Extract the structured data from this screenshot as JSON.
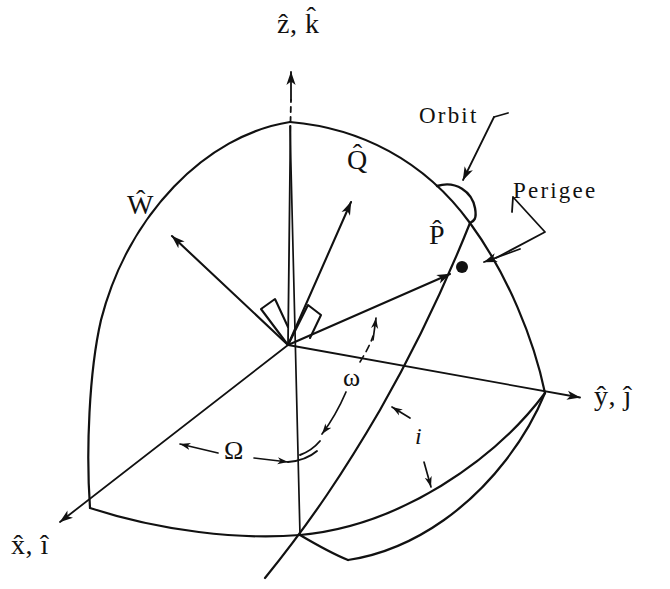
{
  "figure": {
    "background_color": "#ffffff",
    "stroke_color": "#111111",
    "width": 670,
    "height": 589
  },
  "labels": {
    "z_axis": "ẑ, k̂",
    "y_axis": "ŷ, ĵ",
    "x_axis": "x̂, î",
    "w_vector": "Ŵ",
    "q_vector": "Q̂",
    "p_vector": "P̂",
    "orbit": "Orbit",
    "perigee": "Perigee",
    "raan_symbol": "Ω",
    "arg_perigee_symbol": "ω",
    "inclination_symbol": "i"
  },
  "annotations": [
    {
      "name": "z-axis-label",
      "text": "ẑ, k̂",
      "x": 277,
      "y": 12,
      "kind": "axis"
    },
    {
      "name": "y-axis-label",
      "text": "ŷ, ĵ",
      "x": 592,
      "y": 381,
      "kind": "axis"
    },
    {
      "name": "x-axis-label",
      "text": "x̂, î",
      "x": 10,
      "y": 530,
      "kind": "axis"
    },
    {
      "name": "w-vector-label",
      "text": "Ŵ",
      "x": 128,
      "y": 192,
      "kind": "vector"
    },
    {
      "name": "q-vector-label",
      "text": "Q̂",
      "x": 347,
      "y": 147,
      "kind": "vector"
    },
    {
      "name": "p-vector-label",
      "text": "P̂",
      "x": 429,
      "y": 222,
      "kind": "vector"
    },
    {
      "name": "orbit-label",
      "text": "Orbit",
      "x": 419,
      "y": 105,
      "kind": "word"
    },
    {
      "name": "perigee-label",
      "text": "Perigee",
      "x": 513,
      "y": 180,
      "kind": "word"
    },
    {
      "name": "raan-angle-label",
      "text": "Ω",
      "x": 225,
      "y": 440,
      "kind": "greek"
    },
    {
      "name": "arg-perigee-angle-label",
      "text": "ω",
      "x": 343,
      "y": 366,
      "kind": "greek"
    },
    {
      "name": "inclination-angle-label",
      "text": "i",
      "x": 414,
      "y": 424,
      "kind": "greek-small"
    }
  ],
  "geometry": {
    "origin": {
      "x": 288,
      "y": 345
    },
    "north_pole": {
      "x": 290,
      "y": 122
    },
    "ascending_node": {
      "x": 90,
      "y": 508
    },
    "descending_node_region": {
      "x": 300,
      "y": 535
    },
    "y_axis_sphere_crossing": {
      "x": 545,
      "y": 393
    },
    "perigee_point": {
      "x": 462,
      "y": 267
    },
    "z_arrow_tip": {
      "x": 291,
      "y": 70
    },
    "y_arrow_tip": {
      "x": 583,
      "y": 398
    },
    "x_arrow_tip": {
      "x": 57,
      "y": 524
    },
    "w_arrow_tip": {
      "x": 168,
      "y": 233
    },
    "q_arrow_tip": {
      "x": 350,
      "y": 198
    },
    "p_arrow_tip": {
      "x": 452,
      "y": 272
    }
  }
}
